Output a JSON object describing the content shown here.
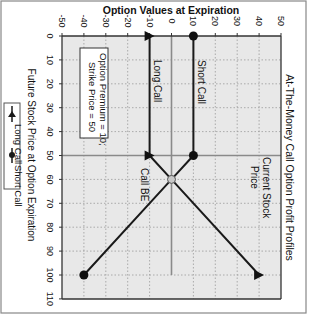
{
  "chart_data": {
    "type": "line",
    "orientation": "rotated 90 degrees clockwise (x-axis vertical, y-axis horizontal)",
    "title": "At-The-Money Call Option Profit Profiles",
    "xlabel": "Future Stock Price at Option Expiration",
    "ylabel": "Option Values at Expiration",
    "x_ticks": [
      0,
      10,
      20,
      30,
      40,
      50,
      60,
      70,
      80,
      90,
      100,
      110
    ],
    "y_ticks": [
      -50,
      -40,
      -30,
      -20,
      -10,
      0,
      10,
      20,
      30,
      40,
      50
    ],
    "xlim": [
      0,
      110
    ],
    "ylim": [
      -50,
      50
    ],
    "grid": true,
    "series": [
      {
        "name": "Long Call",
        "marker": "triangle",
        "x": [
          0,
          50,
          60,
          100
        ],
        "y": [
          -10,
          -10,
          0,
          40
        ],
        "marker_points": [
          [
            0,
            -10
          ],
          [
            50,
            -10
          ],
          [
            100,
            40
          ]
        ]
      },
      {
        "name": "Short Call",
        "marker": "circle",
        "x": [
          0,
          50,
          60,
          100
        ],
        "y": [
          10,
          10,
          0,
          -40
        ],
        "marker_points": [
          [
            0,
            10
          ],
          [
            50,
            10
          ],
          [
            100,
            -40
          ]
        ]
      }
    ],
    "breakeven_point": {
      "x": 60,
      "y": 0
    },
    "annotations": [
      {
        "text": "Long Call",
        "x": 15,
        "y": -10
      },
      {
        "text": "Short Call",
        "x": 15,
        "y": 10
      },
      {
        "text": "Call BE",
        "x": 62,
        "y": -8
      },
      {
        "text": "Current Stock Price",
        "x": 55,
        "y": 38
      },
      {
        "text": "Option Premium = 10; Strike Price = 50",
        "x": 25,
        "y": -38
      }
    ],
    "reference_lines": {
      "current_stock_price": 50,
      "zero_value": 0
    },
    "legend": [
      "Long Call",
      "Short Call"
    ],
    "legend_position": "left (bottom of unrotated chart)"
  },
  "labels": {
    "title": "At-The-Money Call Option Profit Profiles",
    "xlabel": "Future Stock Price at Option Expiration",
    "ylabel": "Option Values at Expiration",
    "long_call": "Long Call",
    "short_call": "Short Call",
    "call_be": "Call BE",
    "current_stock_1": "Current Stock",
    "current_stock_2": "Price",
    "premium_1": "Option Premium = 10;",
    "premium_2": "Strike Price = 50",
    "legend_long": "Long Call",
    "legend_short": "Short Call"
  },
  "colors": {
    "plot_bg": "#e8e8e8",
    "line": "#1a1a1a",
    "grid": "#9a9a9a",
    "ref_line": "#8a8a8a",
    "be_marker": "#c8c8c8"
  }
}
